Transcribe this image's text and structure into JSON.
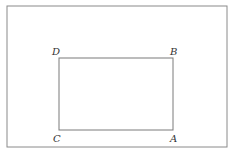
{
  "diagram": {
    "type": "geometry-rectangle",
    "outer_frame": {
      "x": 7,
      "y": 6,
      "width": 220,
      "height": 141,
      "stroke": "#8a8a8a"
    },
    "rectangle": {
      "x": 59,
      "y": 58,
      "width": 114,
      "height": 72,
      "stroke": "#7a7a7a"
    },
    "vertices": [
      {
        "name": "D",
        "label": "D",
        "x": 52,
        "y": 55
      },
      {
        "name": "B",
        "label": "B",
        "x": 170,
        "y": 55
      },
      {
        "name": "C",
        "label": "C",
        "x": 53,
        "y": 142
      },
      {
        "name": "A",
        "label": "A",
        "x": 170,
        "y": 142
      }
    ]
  }
}
